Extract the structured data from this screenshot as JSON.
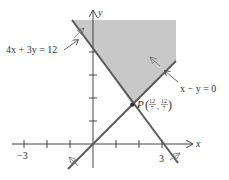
{
  "diagram": {
    "colors": {
      "shade": "#c8c8c8",
      "line": "#5a5a5a",
      "axis": "#444444",
      "text": "#333333"
    },
    "axes": {
      "x_label": "x",
      "y_label": "y",
      "x_tick_labels": {
        "neg3": "−3",
        "pos3": "3"
      }
    },
    "lines": {
      "line1_label": "4x + 3y = 12",
      "line2_label": "x − y = 0"
    },
    "point": {
      "name": "P",
      "x_num": "12",
      "x_den": "7",
      "y_num": "12",
      "y_den": "7"
    }
  }
}
